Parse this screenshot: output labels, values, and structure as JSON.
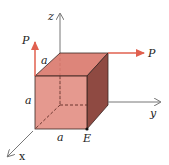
{
  "diagram": {
    "type": "cube-with-forces",
    "axes": {
      "z": "z",
      "y": "y",
      "x": "x"
    },
    "edge_labels": {
      "top": "a",
      "left": "a",
      "bottom": "a"
    },
    "forces": [
      {
        "label": "P",
        "direction": "+z",
        "at": "front-top-left corner"
      },
      {
        "label": "P",
        "direction": "+y",
        "at": "back-top-right corner"
      }
    ],
    "point_label": "E",
    "colors": {
      "front_face": "#e0877b",
      "top_face": "#d9786c",
      "side_face": "#8f4a42",
      "force_arrow": "#e0604f",
      "axis": "#777777",
      "edge": "#3a2622"
    }
  }
}
